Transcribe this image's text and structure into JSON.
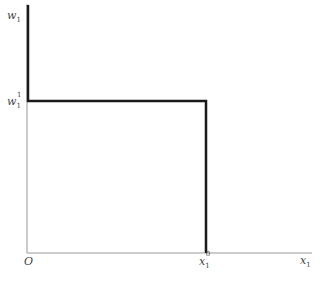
{
  "axes": {
    "y_label": {
      "base": "w",
      "sub": "1"
    },
    "x_label": {
      "base": "x",
      "sub": "1"
    },
    "origin_label": "O"
  },
  "ticks": {
    "y_tick": {
      "base": "w",
      "sub": "1",
      "sup": "1"
    },
    "x_tick": {
      "base": "x",
      "sub": "1",
      "sup": "0"
    }
  },
  "curve": {
    "description": "Step function: vertical segment along the w1 axis above w1^1, horizontal at w1^1 to x1^0, then vertical down to x-axis",
    "color": "#1a1a1a"
  },
  "axis_color": "#888888"
}
